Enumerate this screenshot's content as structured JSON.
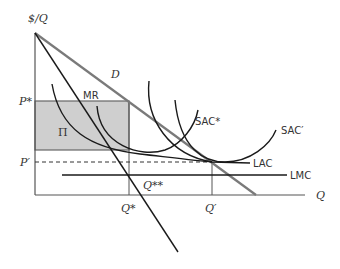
{
  "diagram": {
    "axes": {
      "y_label": "$/Q",
      "x_label": "Q"
    },
    "price_labels": {
      "p_star": "P*",
      "p_prime": "P′"
    },
    "quantity_labels": {
      "q_star": "Q*",
      "q_prime": "Q′",
      "q_double_star": "Q**"
    },
    "curve_labels": {
      "demand": "D",
      "marginal_revenue": "MR",
      "sac_star": "SAC*",
      "sac_prime": "SAC′",
      "lac": "LAC",
      "lmc": "LMC"
    },
    "region_labels": {
      "profit": "Π"
    },
    "colors": {
      "axis": "#555555",
      "demand_line": "#7a7a7a",
      "curves": "#1a1a1a",
      "profit_fill": "#cfcfcf",
      "profit_border": "#666666",
      "text": "#333333"
    }
  }
}
